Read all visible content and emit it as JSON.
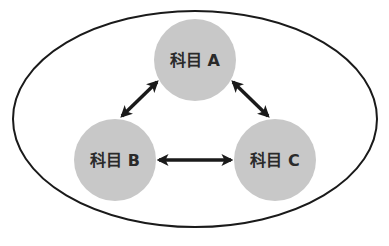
{
  "diagram": {
    "container": {
      "shape": "ellipse",
      "stroke": "#1a1a1a"
    },
    "nodes": [
      {
        "id": "A",
        "label": "科目 A",
        "fill": "#c8c8c8"
      },
      {
        "id": "B",
        "label": "科目 B",
        "fill": "#c8c8c8"
      },
      {
        "id": "C",
        "label": "科目 C",
        "fill": "#c8c8c8"
      }
    ],
    "edges": [
      {
        "from": "A",
        "to": "B",
        "type": "bidirectional"
      },
      {
        "from": "A",
        "to": "C",
        "type": "bidirectional"
      },
      {
        "from": "B",
        "to": "C",
        "type": "bidirectional"
      }
    ],
    "arrow_color": "#1a1a1a"
  }
}
